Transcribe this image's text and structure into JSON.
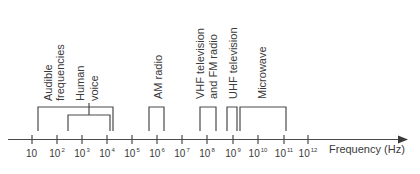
{
  "diagram": {
    "axis": {
      "label": "Frequency (Hz)",
      "ticks": [
        {
          "base": "10",
          "exp": ""
        },
        {
          "base": "10",
          "exp": "2"
        },
        {
          "base": "10",
          "exp": "3"
        },
        {
          "base": "10",
          "exp": "4"
        },
        {
          "base": "10",
          "exp": "5"
        },
        {
          "base": "10",
          "exp": "6"
        },
        {
          "base": "10",
          "exp": "7"
        },
        {
          "base": "10",
          "exp": "8"
        },
        {
          "base": "10",
          "exp": "9"
        },
        {
          "base": "10",
          "exp": "10"
        },
        {
          "base": "10",
          "exp": "11"
        },
        {
          "base": "10",
          "exp": "12"
        }
      ]
    },
    "bands": [
      {
        "name": "audible-frequencies",
        "lines": [
          "Audible",
          "frequencies"
        ],
        "range": "20 Hz – 20 kHz"
      },
      {
        "name": "human-voice",
        "lines": [
          "Human",
          "voice"
        ],
        "range": "~300 Hz – 15 kHz"
      },
      {
        "name": "am-radio",
        "lines": [
          "AM radio"
        ],
        "range": "~0.5 MHz – 1.6 MHz"
      },
      {
        "name": "vhf-fm",
        "lines": [
          "VHF television",
          "and FM radio"
        ],
        "range": "~50 MHz – 200 MHz"
      },
      {
        "name": "uhf-television",
        "lines": [
          "UHF television"
        ],
        "range": "~470 MHz – 1 GHz"
      },
      {
        "name": "microwave",
        "lines": [
          "Microwave"
        ],
        "range": "~1 GHz – 100 GHz"
      }
    ],
    "colors": {
      "line": "#4a4a4a",
      "text": "#3a3a3a",
      "background": "#ffffff"
    }
  }
}
